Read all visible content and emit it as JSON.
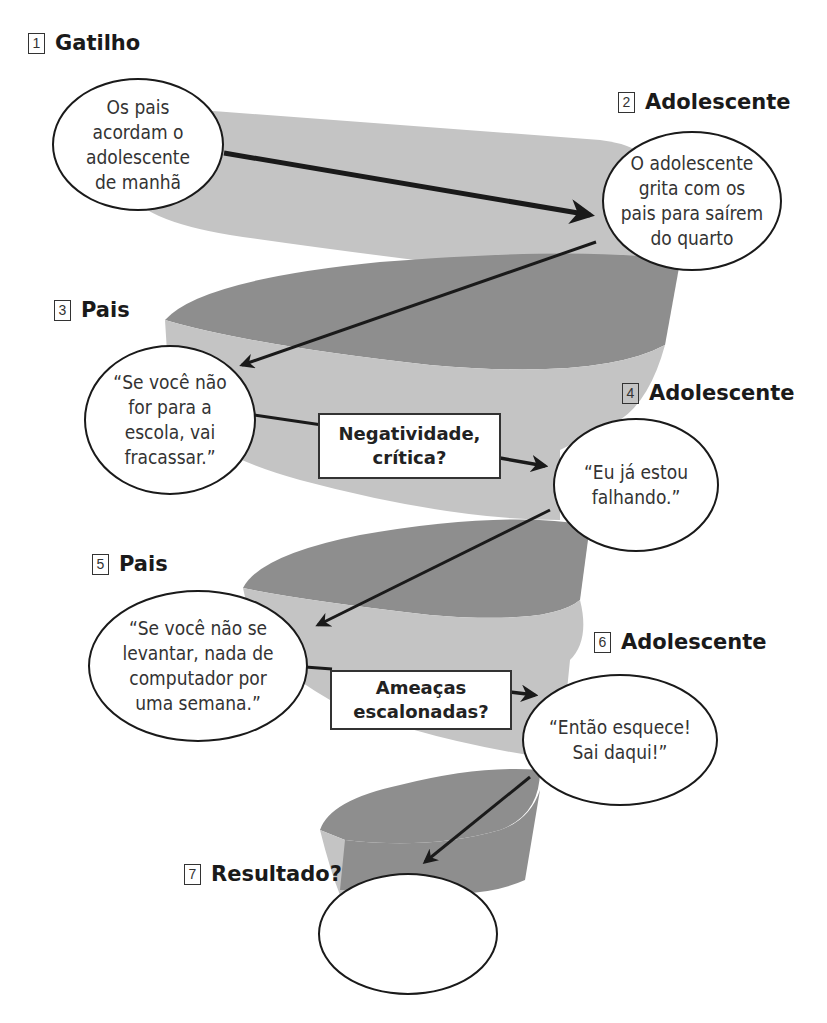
{
  "colors": {
    "band_light": "#c4c4c4",
    "band_dark": "#8e8e8e",
    "arrow": "#1a1a1a",
    "bubble_border": "#1a1a1a"
  },
  "steps": [
    {
      "number": "1",
      "title": "Gatilho",
      "bubble": "Os pais\nacordam o\nadolescente\nde manhã"
    },
    {
      "number": "2",
      "title": "Adolescente",
      "bubble": "O adolescente\ngrita com os\npais para saírem\ndo quarto"
    },
    {
      "number": "3",
      "title": "Pais",
      "bubble": "“Se você não\nfor para a\nescola, vai\nfracassar.”"
    },
    {
      "number": "4",
      "title": "Adolescente",
      "bubble": "“Eu já estou\nfalhando.”"
    },
    {
      "number": "5",
      "title": "Pais",
      "bubble": "“Se você não se\nlevantar, nada de\ncomputador por\numa semana.”"
    },
    {
      "number": "6",
      "title": "Adolescente",
      "bubble": "“Então esquece!\nSai daqui!”"
    },
    {
      "number": "7",
      "title": "Resultado?",
      "bubble": ""
    }
  ],
  "callouts": [
    {
      "text": "Negatividade,\ncrítica?"
    },
    {
      "text": "Ameaças\nescalonadas?"
    }
  ],
  "icons": {
    "arrow": "arrow-icon",
    "spiral": "spiral-band"
  }
}
